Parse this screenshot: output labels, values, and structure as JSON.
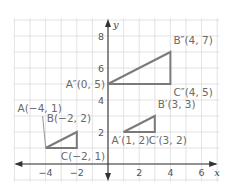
{
  "figure": {
    "type": "coordinate-plane-transformations",
    "axes": {
      "x_label": "x",
      "y_label": "y",
      "x_ticks": [
        {
          "v": -4,
          "label": "−4"
        },
        {
          "v": -2,
          "label": "−2"
        },
        {
          "v": 2,
          "label": "2"
        },
        {
          "v": 4,
          "label": "4"
        },
        {
          "v": 6,
          "label": "6"
        }
      ],
      "y_ticks": [
        {
          "v": 2,
          "label": "2"
        },
        {
          "v": 4,
          "label": "4"
        },
        {
          "v": 6,
          "label": "6"
        },
        {
          "v": 8,
          "label": "8"
        }
      ],
      "x_range": [
        -6,
        7
      ],
      "y_range": [
        -1,
        9
      ]
    },
    "colors": {
      "grid": "#dcdcdc",
      "axis": "#333333",
      "triangle": "#7a7a7a",
      "label": "#6a6a6a"
    },
    "triangles": [
      {
        "name": "ABC",
        "points": [
          {
            "id": "A",
            "x": -4,
            "y": 1,
            "label": "A(−4, 1)"
          },
          {
            "id": "B",
            "x": -2,
            "y": 2,
            "label": "B(−2, 2)"
          },
          {
            "id": "C",
            "x": -2,
            "y": 1,
            "label": "C(−2, 1)"
          }
        ]
      },
      {
        "name": "A'B'C'",
        "points": [
          {
            "id": "A'",
            "x": 1,
            "y": 2,
            "label": "A′(1, 2)"
          },
          {
            "id": "B'",
            "x": 3,
            "y": 3,
            "label": "B′(3, 3)"
          },
          {
            "id": "C'",
            "x": 3,
            "y": 2,
            "label": "C′(3, 2)"
          }
        ]
      },
      {
        "name": "A''B''C''",
        "points": [
          {
            "id": "A''",
            "x": 0,
            "y": 5,
            "label": "A″(0, 5)"
          },
          {
            "id": "B''",
            "x": 4,
            "y": 7,
            "label": "B″(4, 7)"
          },
          {
            "id": "C''",
            "x": 4,
            "y": 5,
            "label": "C″(4, 5)"
          }
        ]
      }
    ]
  }
}
